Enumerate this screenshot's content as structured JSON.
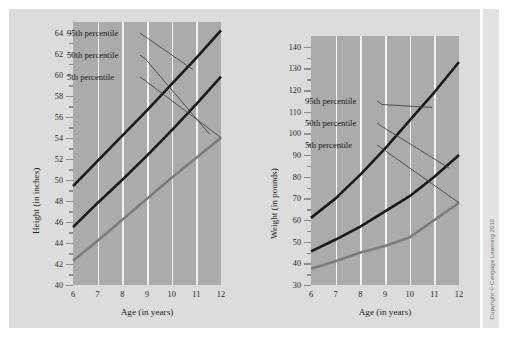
{
  "figure": {
    "background_color": "#dcdcdc",
    "plot_background_color": "#ababab",
    "gridline_color": "#f2f2f2",
    "copyright": "Copyright © Cengage Learning 2010"
  },
  "chart_data": [
    {
      "id": "height-chart",
      "type": "line",
      "title": "",
      "xlabel": "Age (in years)",
      "ylabel": "Height (in inches)",
      "x": [
        6,
        7,
        8,
        9,
        10,
        11,
        12
      ],
      "xlim": [
        6,
        12
      ],
      "ylim": [
        40,
        65
      ],
      "xticks": [
        "6",
        "7",
        "8",
        "9",
        "10",
        "11",
        "12"
      ],
      "yticks": [
        "40",
        "42",
        "44",
        "46",
        "48",
        "50",
        "52",
        "54",
        "56",
        "58",
        "60",
        "62",
        "64"
      ],
      "ytick_values": [
        40,
        42,
        44,
        46,
        48,
        50,
        52,
        54,
        56,
        58,
        60,
        62,
        64
      ],
      "grid": true,
      "legend_position": "inside-upper-left",
      "series": [
        {
          "name": "95th percentile",
          "color": "#1a1a1a",
          "values": [
            49.4,
            51.8,
            54.2,
            56.6,
            59.1,
            61.6,
            64.2
          ]
        },
        {
          "name": "50th percentile",
          "color": "#1a1a1a",
          "values": [
            45.5,
            47.8,
            50.0,
            52.3,
            54.7,
            57.2,
            59.8
          ]
        },
        {
          "name": "5th percentile",
          "color": "#7d7d7d",
          "values": [
            42.3,
            44.2,
            46.2,
            48.2,
            50.2,
            52.1,
            54.0
          ]
        }
      ]
    },
    {
      "id": "weight-chart",
      "type": "line",
      "title": "",
      "xlabel": "Age (in years)",
      "ylabel": "Weight (in pounds)",
      "x": [
        6,
        7,
        8,
        9,
        10,
        11,
        12
      ],
      "xlim": [
        6,
        12
      ],
      "ylim": [
        30,
        145
      ],
      "xticks": [
        "6",
        "7",
        "8",
        "9",
        "10",
        "11",
        "12"
      ],
      "yticks": [
        "30",
        "40",
        "50",
        "60",
        "70",
        "80",
        "90",
        "100",
        "110",
        "120",
        "130",
        "140"
      ],
      "ytick_values": [
        30,
        40,
        50,
        60,
        70,
        80,
        90,
        100,
        110,
        120,
        130,
        140
      ],
      "grid": true,
      "legend_position": "inside-upper-left",
      "series": [
        {
          "name": "95th percentile",
          "color": "#1a1a1a",
          "values": [
            61,
            70,
            81,
            93,
            106,
            119,
            133
          ]
        },
        {
          "name": "50th percentile",
          "color": "#1a1a1a",
          "values": [
            45.5,
            51,
            57,
            64,
            71,
            80,
            90
          ]
        },
        {
          "name": "5th percentile",
          "color": "#7d7d7d",
          "values": [
            37.5,
            41,
            45,
            48,
            52,
            60,
            68
          ]
        }
      ]
    }
  ],
  "height_chart": {
    "xlabel": "Age (in years)",
    "ylabel": "Height (in inches)",
    "annotations": [
      {
        "label": "95th percentile"
      },
      {
        "label": "50th percentile"
      },
      {
        "label": "5th percentile"
      }
    ]
  },
  "weight_chart": {
    "xlabel": "Age (in years)",
    "ylabel": "Weight (in pounds)",
    "annotations": [
      {
        "label": "95th percentile"
      },
      {
        "label": "50th percentile"
      },
      {
        "label": "5th percentile"
      }
    ]
  }
}
